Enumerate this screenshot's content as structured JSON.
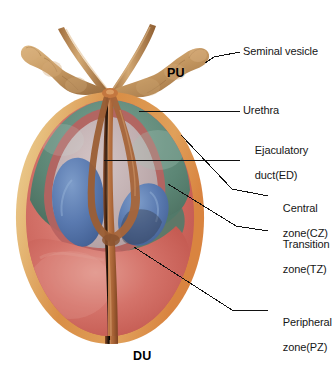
{
  "figure": {
    "background_color": "#ffffff",
    "width": 332,
    "height": 379
  },
  "callout_labels": [
    {
      "id": "seminal-vesicle",
      "text": "Seminal vesicle",
      "lines": [
        "Seminal vesicle"
      ],
      "x": 243,
      "y": 51
    },
    {
      "id": "urethra",
      "text": "Urethra",
      "lines": [
        "Urethra"
      ],
      "x": 243,
      "y": 105
    },
    {
      "id": "ejaculatory-duct",
      "text": "Ejaculatory duct(ED)",
      "lines": [
        "Ejaculatory",
        "duct(ED)"
      ],
      "x": 243,
      "y": 137
    },
    {
      "id": "central-zone",
      "text": "Central zone(CZ)",
      "lines": [
        "Central",
        "zone(CZ)"
      ],
      "x": 271,
      "y": 190
    },
    {
      "id": "transition-zone",
      "text": "Transition zone(TZ)",
      "lines": [
        "Transition",
        "zone(TZ)"
      ],
      "x": 271,
      "y": 226
    },
    {
      "id": "peripheral-zone",
      "text": "Peripheral zone(PZ)",
      "lines": [
        "Peripheral",
        "zone(PZ)"
      ],
      "x": 271,
      "y": 297
    }
  ],
  "inline_labels": [
    {
      "id": "pu",
      "text": "PU",
      "meaning": "prostatic urethra",
      "x": 167,
      "y": 66
    },
    {
      "id": "du",
      "text": "DU",
      "meaning": "distal urethra",
      "x": 133,
      "y": 349
    }
  ],
  "zones": [
    {
      "id": "capsule",
      "name": "Prostatic capsule",
      "color": "#e3bb7c"
    },
    {
      "id": "capsule-rim",
      "name": "Capsule rim",
      "color": "#d4833f"
    },
    {
      "id": "peripheral-zone",
      "name": "Peripheral zone(PZ)",
      "color": "#cc6257"
    },
    {
      "id": "central-zone",
      "name": "Central zone(CZ)",
      "color": "#5d8474"
    },
    {
      "id": "transition-zone",
      "name": "Transition zone(TZ)",
      "color": "#5a7ab0"
    },
    {
      "id": "anterior-stroma",
      "name": "Anterior fibromuscular stroma",
      "color": "#bfb3b5"
    },
    {
      "id": "seminal-vesicle",
      "name": "Seminal vesicle",
      "color": "#c79a63"
    },
    {
      "id": "duct",
      "name": "Duct / urethra",
      "color": "#a4613a"
    }
  ],
  "leader_lines": [
    {
      "id": "leader-seminal-vesicle",
      "from": [
        205,
        63
      ],
      "to": [
        240,
        53
      ]
    },
    {
      "id": "leader-urethra",
      "from": [
        139,
        111
      ],
      "to": [
        240,
        111
      ]
    },
    {
      "id": "leader-ejaculatory-duct",
      "from": [
        104,
        160
      ],
      "to": [
        240,
        160
      ]
    },
    {
      "id": "leader-central-zone",
      "from": [
        181,
        135
      ],
      "to": [
        268,
        196
      ]
    },
    {
      "id": "leader-transition-zone",
      "from": [
        168,
        184
      ],
      "to": [
        268,
        232
      ]
    },
    {
      "id": "leader-peripheral-zone",
      "from": [
        134,
        247
      ],
      "to": [
        268,
        310
      ]
    }
  ]
}
